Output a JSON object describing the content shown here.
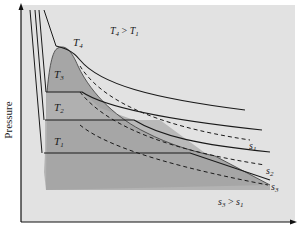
{
  "diagram": {
    "type": "pressure-volume phase diagram",
    "axes": {
      "y_label": "Pressure",
      "x_label": ""
    },
    "isotherms": [
      {
        "id": "T1",
        "label": "T",
        "sub": "1"
      },
      {
        "id": "T2",
        "label": "T",
        "sub": "2"
      },
      {
        "id": "T3",
        "label": "T",
        "sub": "3"
      },
      {
        "id": "T4",
        "label": "T",
        "sub": "4"
      }
    ],
    "isentropes": [
      {
        "id": "s1",
        "label": "s",
        "sub": "1"
      },
      {
        "id": "s2",
        "label": "s",
        "sub": "2"
      },
      {
        "id": "s3",
        "label": "s",
        "sub": "3"
      }
    ],
    "annotations": {
      "temperature_relation": {
        "a": "T",
        "a_sub": "4",
        "op": ">",
        "b": "T",
        "b_sub": "1"
      },
      "entropy_relation": {
        "a": "s",
        "a_sub": "3",
        "op": ">",
        "b": "s",
        "b_sub": "1"
      }
    },
    "colors": {
      "plot_background": "#e6e6e6",
      "outer_panel": "#d9d9d9",
      "dome_fill": "#a9a9a9",
      "region_fill": "#bdbdbd",
      "line": "#1a1a1a",
      "axis": "#111111"
    }
  }
}
